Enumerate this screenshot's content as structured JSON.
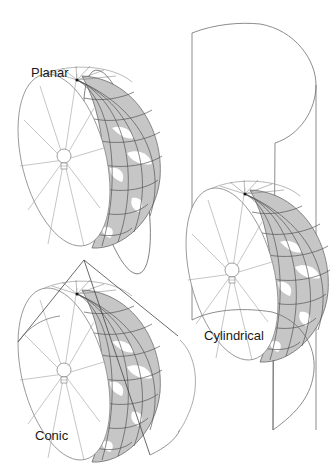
{
  "diagram": {
    "colors": {
      "line": "#6e6e6e",
      "light_line": "#9a9a9a",
      "land_fill": "#c4c4c4",
      "grid": "#555555",
      "background": "#ffffff"
    },
    "projections": [
      {
        "id": "planar",
        "label": "Planar",
        "surface": "plane",
        "light_source": "lightbulb-icon"
      },
      {
        "id": "conic",
        "label": "Conic",
        "surface": "cone",
        "light_source": "lightbulb-icon"
      },
      {
        "id": "cylindrical",
        "label": "Cylindrical",
        "surface": "cylinder",
        "light_source": "lightbulb-icon"
      }
    ]
  }
}
